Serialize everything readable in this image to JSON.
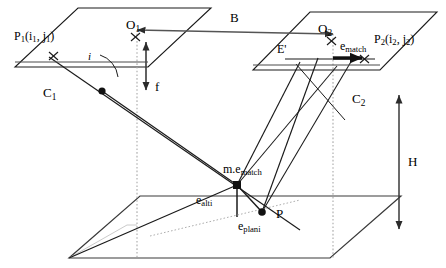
{
  "figure": {
    "type": "technical-line-diagram",
    "background_color": "#ffffff",
    "stroke_color": "#1a1a1a",
    "dotted_color": "#9a9a9a"
  },
  "labels": {
    "image_point_left": {
      "base": "P",
      "sub1": "1",
      "args": "(i",
      "args_sub": "1",
      "args_mid": ", j",
      "args_sub2": "1",
      "args_end": ")",
      "full": "P1(i1, j1)"
    },
    "image_point_right": {
      "base": "P",
      "sub1": "2",
      "args": "(i",
      "args_sub": "2",
      "args_mid": ", j",
      "args_sub2": "2",
      "args_end": ")",
      "full": "P2(i2, j2)"
    },
    "principal_point_left": {
      "base": "O",
      "sub": "1",
      "full": "O1"
    },
    "principal_point_right": {
      "base": "O",
      "sub": "2",
      "full": "O2"
    },
    "camera_center_left": {
      "base": "C",
      "sub": "1",
      "full": "C1"
    },
    "camera_center_right": {
      "base": "C",
      "sub": "2",
      "full": "C2"
    },
    "baseline": "B",
    "focal_length": "f",
    "flying_height": "H",
    "incidence_angle": "i",
    "epipolar_line": "E'",
    "match_error": {
      "base": "e",
      "sub": "match",
      "full": "ematch"
    },
    "match_error_ground": {
      "prefix": "m.",
      "base": "e",
      "sub": "match",
      "full": "m.ematch"
    },
    "altimetric_error": {
      "base": "e",
      "sub": "alti",
      "full": "ealti"
    },
    "planimetric_error": {
      "base": "e",
      "sub": "plani",
      "full": "eplani"
    },
    "ground_point": "P"
  }
}
